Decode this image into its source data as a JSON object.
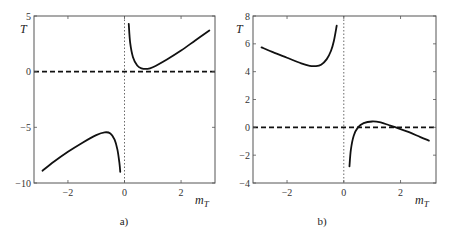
{
  "chart_data": [
    {
      "type": "line",
      "panel": "a",
      "caption": "a)",
      "xlabel": "m_T",
      "ylabel": "T",
      "xlim": [
        -3.2,
        3.2
      ],
      "ylim": [
        -10,
        5
      ],
      "xticks": [
        -2,
        0,
        2
      ],
      "yticks": [
        5,
        0,
        -5,
        -10
      ],
      "grid": false,
      "reference_lines": [
        {
          "orientation": "horizontal",
          "value": 0,
          "style": "dashed"
        },
        {
          "orientation": "vertical",
          "value": 0,
          "style": "dotted"
        }
      ],
      "series": [
        {
          "name": "left branch",
          "x": [
            -2.9,
            -2.5,
            -2.0,
            -1.5,
            -1.0,
            -0.7,
            -0.5,
            -0.35,
            -0.25,
            -0.18,
            -0.15
          ],
          "y": [
            -8.9,
            -8.1,
            -7.2,
            -6.4,
            -5.7,
            -5.45,
            -5.55,
            -6.1,
            -7.0,
            -8.2,
            -9.0
          ]
        },
        {
          "name": "right branch",
          "x": [
            0.15,
            0.2,
            0.3,
            0.45,
            0.6,
            0.8,
            1.0,
            1.5,
            2.0,
            2.5,
            3.0
          ],
          "y": [
            4.3,
            2.6,
            1.3,
            0.55,
            0.3,
            0.25,
            0.4,
            1.1,
            1.9,
            2.8,
            3.7
          ]
        }
      ]
    },
    {
      "type": "line",
      "panel": "b",
      "caption": "b)",
      "xlabel": "m_T",
      "ylabel": "T",
      "xlim": [
        -3.2,
        3.25
      ],
      "ylim": [
        -4,
        8
      ],
      "xticks": [
        -2,
        0,
        2
      ],
      "yticks": [
        8,
        6,
        4,
        2,
        0,
        -2,
        -4
      ],
      "grid": false,
      "reference_lines": [
        {
          "orientation": "horizontal",
          "value": 0,
          "style": "dashed"
        },
        {
          "orientation": "vertical",
          "value": 0,
          "style": "dotted"
        }
      ],
      "series": [
        {
          "name": "left branch",
          "x": [
            -2.9,
            -2.5,
            -2.0,
            -1.5,
            -1.2,
            -1.0,
            -0.8,
            -0.6,
            -0.45,
            -0.35,
            -0.25
          ],
          "y": [
            5.75,
            5.4,
            5.0,
            4.6,
            4.42,
            4.4,
            4.5,
            4.9,
            5.5,
            6.2,
            7.3
          ]
        },
        {
          "name": "right branch",
          "x": [
            0.2,
            0.25,
            0.35,
            0.5,
            0.7,
            1.0,
            1.3,
            1.6,
            1.9,
            2.3,
            2.7,
            3.0
          ],
          "y": [
            -2.8,
            -1.6,
            -0.6,
            0.0,
            0.3,
            0.42,
            0.35,
            0.15,
            -0.05,
            -0.35,
            -0.7,
            -0.95
          ]
        }
      ]
    }
  ],
  "panels": {
    "a": {
      "caption": "a)",
      "ylabel": "T",
      "xlabel_main": "m",
      "xlabel_sub": "T",
      "yticklabels": [
        "5",
        "0",
        "−5",
        "−10"
      ],
      "xticklabels": [
        "−2",
        "0",
        "2"
      ]
    },
    "b": {
      "caption": "b)",
      "ylabel": "T",
      "xlabel_main": "m",
      "xlabel_sub": "T",
      "yticklabels": [
        "8",
        "6",
        "4",
        "2",
        "0",
        "−2",
        "−4"
      ],
      "xticklabels": [
        "−2",
        "0",
        "2"
      ]
    }
  }
}
